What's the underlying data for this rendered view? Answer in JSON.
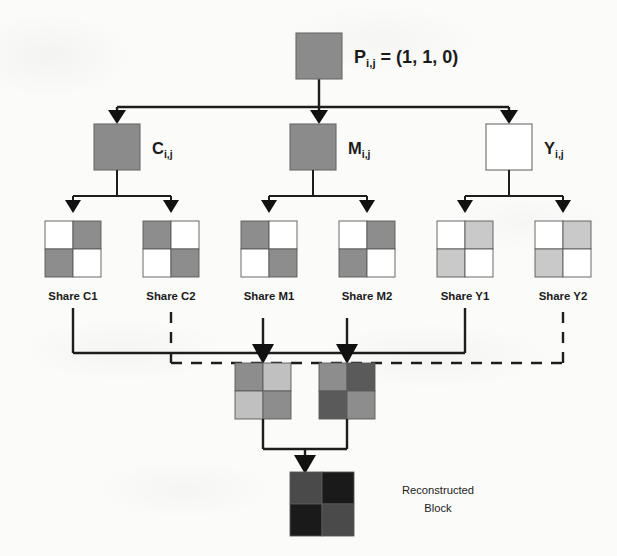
{
  "figure": {
    "title_text": "Visual cryptography share generation and reconstruction",
    "background": "#fbfbfa",
    "ink_color": "#1d1d1d"
  },
  "palette": {
    "white": "#ffffff",
    "light_gray": "#c9c9c9",
    "medium_gray": "#8d8d8d",
    "node_gray": "#8b8b8b",
    "dark_gray": "#5a5a5a",
    "black": "#1a1a1a",
    "border": "#5a5a5a"
  },
  "root": {
    "name": "pixel-node",
    "label_main": "P",
    "label_sub": "i,j",
    "label_rest": " = (1, 1, 0)",
    "fill": "#8b8b8b",
    "x": 296,
    "y": 33,
    "w": 46,
    "h": 46
  },
  "channels": [
    {
      "id": "c",
      "label_main": "C",
      "label_sub": "i,j",
      "fill": "#8b8b8b",
      "filled": true,
      "x": 94,
      "y": 124,
      "w": 46,
      "h": 46
    },
    {
      "id": "m",
      "label_main": "M",
      "label_sub": "i,j",
      "fill": "#8b8b8b",
      "filled": true,
      "x": 290,
      "y": 124,
      "w": 46,
      "h": 46
    },
    {
      "id": "y",
      "label_main": "Y",
      "label_sub": "i,j",
      "fill": "#ffffff",
      "filled": false,
      "x": 486,
      "y": 124,
      "w": 46,
      "h": 46
    }
  ],
  "shares": [
    {
      "id": "c1",
      "label": "Share C1",
      "x": 45,
      "y": 221,
      "size": 56,
      "cells": [
        "#ffffff",
        "#8d8d8d",
        "#8d8d8d",
        "#ffffff"
      ]
    },
    {
      "id": "c2",
      "label": "Share C2",
      "x": 143,
      "y": 221,
      "size": 56,
      "cells": [
        "#8d8d8d",
        "#ffffff",
        "#ffffff",
        "#8d8d8d"
      ]
    },
    {
      "id": "m1",
      "label": "Share M1",
      "x": 241,
      "y": 221,
      "size": 56,
      "cells": [
        "#8d8d8d",
        "#ffffff",
        "#ffffff",
        "#8d8d8d"
      ]
    },
    {
      "id": "m2",
      "label": "Share M2",
      "x": 339,
      "y": 221,
      "size": 56,
      "cells": [
        "#ffffff",
        "#8d8d8d",
        "#8d8d8d",
        "#ffffff"
      ]
    },
    {
      "id": "y1",
      "label": "Share Y1",
      "x": 437,
      "y": 221,
      "size": 56,
      "cells": [
        "#ffffff",
        "#c9c9c9",
        "#c9c9c9",
        "#ffffff"
      ]
    },
    {
      "id": "y2",
      "label": "Share Y2",
      "x": 535,
      "y": 221,
      "size": 56,
      "cells": [
        "#ffffff",
        "#c9c9c9",
        "#c9c9c9",
        "#ffffff"
      ]
    }
  ],
  "stacked": [
    {
      "id": "stack1",
      "x": 235,
      "y": 363,
      "size": 56,
      "cells": [
        "#8d8d8d",
        "#c0c0c0",
        "#c0c0c0",
        "#8d8d8d"
      ]
    },
    {
      "id": "stack2",
      "x": 319,
      "y": 363,
      "size": 56,
      "cells": [
        "#8d8d8d",
        "#5a5a5a",
        "#5a5a5a",
        "#8d8d8d"
      ]
    }
  ],
  "reconstructed": {
    "id": "reconstructed-block",
    "x": 290,
    "y": 472,
    "size": 64,
    "cells": [
      "#4a4a4a",
      "#1a1a1a",
      "#1a1a1a",
      "#4a4a4a"
    ],
    "label_line1": "Reconstructed",
    "label_line2": "Block"
  },
  "connectors": {
    "solid_note": "solid bus joins Share C1 and Share Y1",
    "dashed_note": "dashed bus joins Share C2 and Share Y2",
    "solid_y": 353,
    "dashed_y": 363,
    "solid_left_x": 73,
    "solid_right_x": 465,
    "dashed_left_x": 171,
    "dashed_right_x": 563
  }
}
